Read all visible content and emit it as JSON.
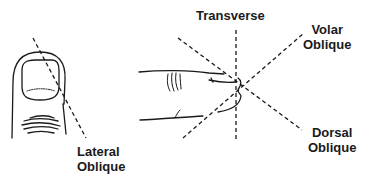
{
  "figure": {
    "type": "finger-xray-projection-diagram",
    "panels": [
      {
        "id": "dorsal-view",
        "description": "Finger tip viewed from dorsal side with nail",
        "projection_line": "Lateral Oblique"
      },
      {
        "id": "lateral-view",
        "description": "Finger viewed from side",
        "projection_lines": [
          "Transverse",
          "Volar Oblique",
          "Dorsal Oblique"
        ]
      }
    ],
    "labels": {
      "lateral_oblique_line1": "Lateral",
      "lateral_oblique_line2": "Oblique",
      "transverse": "Transverse",
      "volar_oblique_line1": "Volar",
      "volar_oblique_line2": "Oblique",
      "dorsal_oblique_line1": "Dorsal",
      "dorsal_oblique_line2": "Oblique"
    },
    "colors": {
      "stroke": "#1a1a1a",
      "background": "#ffffff"
    }
  }
}
